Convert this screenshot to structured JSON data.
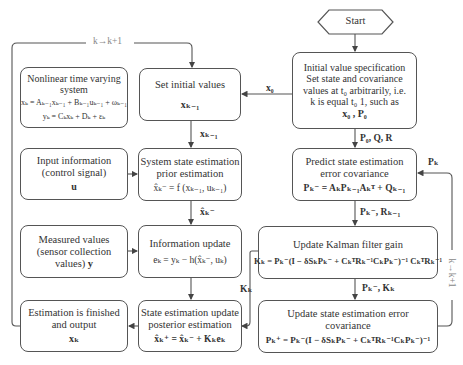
{
  "start": {
    "label": "Start"
  },
  "loop_labels": {
    "top": "k→k+1",
    "right": "k→k+1"
  },
  "initial_spec": {
    "title": "Initial value specification",
    "line1": "Set state and covariance",
    "line2": "values at t₀ arbitrarily, i.e.",
    "line3": "k is equal t₀ 1,  such as",
    "math": "x₀ , P₀"
  },
  "nonlinear": {
    "title1": "Nonlinear time varying",
    "title2": "system",
    "eq1": "xₖ = Aₖ₋₁xₖ₋₁ + Bₖ₋₁uₖ₋₁ + ωₖ₋₁",
    "eq2": "yₖ = Cₖxₖ + Dₖ + εₖ"
  },
  "set_initial": {
    "title": "Set initial values",
    "math": "xₖ₋₁"
  },
  "input_info": {
    "line1": "Input information",
    "line2": "(control signal)",
    "math": "u"
  },
  "system_state": {
    "line1": "System state estimation",
    "line2": "prior estimation",
    "math": "x̂ₖ⁻ = f (xₖ₋₁, uₖ₋₁)"
  },
  "measured": {
    "line1": "Measured values",
    "line2": "(sensor collection",
    "line3": "values)",
    "math": "y"
  },
  "info_update": {
    "title": "Information update",
    "math": "eₖ = yₖ − h(x̂ₖ⁻, uₖ)"
  },
  "finished": {
    "line1": "Estimation is finished",
    "line2": "and output",
    "math": "xₖ"
  },
  "state_update": {
    "line1": "State estimation update",
    "line2": "posterior estimation",
    "math": "x̂ₖ⁺ = x̂ₖ⁻ + Kₖeₖ"
  },
  "predict": {
    "line1": "Predict state estimation",
    "line2": "error covariance",
    "math": "Pₖ⁻ = AₖPₖ₋₁Aₖᵀ + Qₖ₋₁"
  },
  "kalman_gain": {
    "title": "Update Kalman filter gain",
    "math": "Kₖ = Pₖ⁻(I − δSₖPₖ⁻ + CₖᵀRₖ⁻¹CₖPₖ⁻)⁻¹ CₖᵀRₖ⁻¹"
  },
  "update_cov": {
    "line1": "Update state estimation error",
    "line2": "covariance",
    "math": "Pₖ⁺ = Pₖ⁻(I − δSₖPₖ⁻ + CₖᵀRₖ⁻¹CₖPₖ⁻)⁻¹"
  },
  "edge_labels": {
    "x0": "x₀",
    "xk1_a": "xₖ₋₁",
    "xhat": "x̂ₖ⁻",
    "p0qr": "P₀, Q, R",
    "pk_r": "Pₖ⁻, Rₖ₋₁",
    "pk_k": "Pₖ⁻, Kₖ",
    "kk": "Kₖ",
    "pk_back": "Pₖ"
  }
}
